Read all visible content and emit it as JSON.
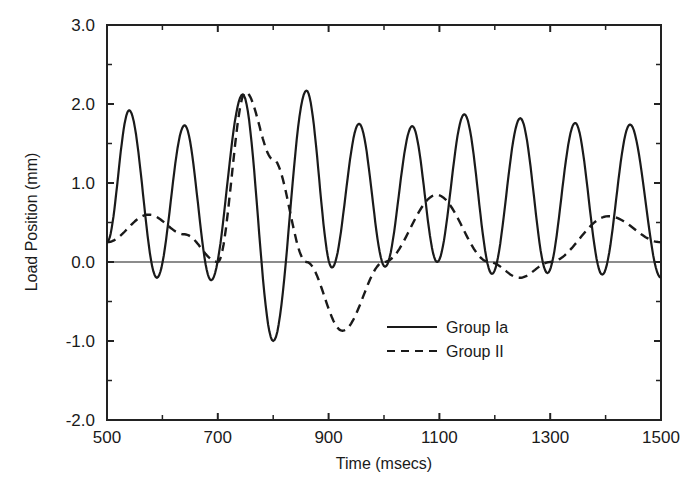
{
  "chart_data": {
    "type": "line",
    "title": "",
    "xlabel": "Time (msecs)",
    "ylabel": "Load Position (mm)",
    "xlim": [
      500,
      1500
    ],
    "ylim": [
      -2.0,
      3.0
    ],
    "xticks": [
      500,
      700,
      900,
      1100,
      1300,
      1500
    ],
    "xtick_labels": [
      "500",
      "700",
      "900",
      "1100",
      "1300",
      "1500"
    ],
    "xminor_ticks": [
      600,
      800,
      1000,
      1200,
      1400
    ],
    "yticks": [
      -2.0,
      -1.0,
      0.0,
      1.0,
      2.0,
      3.0
    ],
    "ytick_labels": [
      "-2.0",
      "-1.0",
      "0.0",
      "1.0",
      "2.0",
      "3.0"
    ],
    "yminor_ticks": [
      -1.5,
      -0.5,
      0.5,
      1.5,
      2.5
    ],
    "grid": false,
    "zero_line": true,
    "legend_position": "lower-center-right",
    "series": [
      {
        "name": "Group Ia",
        "style": "solid",
        "x": [
          500,
          540,
          590,
          640,
          688,
          745,
          800,
          860,
          906,
          955,
          1002,
          1051,
          1096,
          1145,
          1195,
          1246,
          1295,
          1345,
          1394,
          1444,
          1500
        ],
        "y": [
          0.25,
          1.92,
          -0.2,
          1.73,
          -0.23,
          2.12,
          -1.0,
          2.17,
          -0.07,
          1.75,
          -0.06,
          1.72,
          0.0,
          1.87,
          -0.15,
          1.82,
          -0.14,
          1.76,
          -0.16,
          1.74,
          -0.2
        ]
      },
      {
        "name": "Group II",
        "style": "dashed",
        "x": [
          500,
          575,
          640,
          700,
          750,
          800,
          860,
          925,
          1000,
          1095,
          1190,
          1245,
          1300,
          1405,
          1500
        ],
        "y": [
          0.25,
          0.6,
          0.35,
          0.0,
          2.15,
          1.3,
          0.0,
          -0.87,
          0.0,
          0.85,
          0.0,
          -0.2,
          0.0,
          0.58,
          0.25
        ]
      }
    ]
  },
  "legend": {
    "items": [
      {
        "label": "Group Ia",
        "style": "solid"
      },
      {
        "label": "Group II",
        "style": "dashed"
      }
    ]
  },
  "axes": {
    "x_title": "Time (msecs)",
    "y_title": "Load Position (mm)"
  },
  "colors": {
    "line": "#1a1a1a",
    "axis": "#222222",
    "background": "#ffffff"
  }
}
